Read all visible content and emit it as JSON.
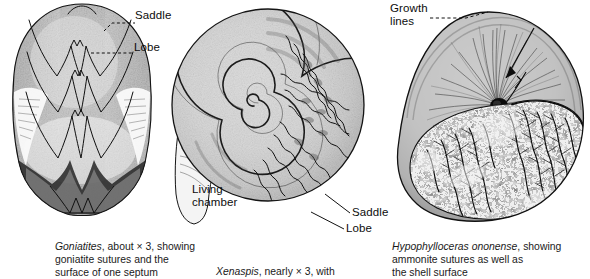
{
  "figure": {
    "background_color": "#ffffff",
    "ink_color": "#1a1a1a",
    "panels": [
      {
        "id": "goniatites",
        "subject": "goniatite-fossil-septum",
        "labels": [
          {
            "name": "saddle",
            "text": "Saddle"
          },
          {
            "name": "lobe",
            "text": "Lobe"
          }
        ],
        "caption": {
          "species": "Goniatites",
          "rest": ", about × 3, showing\ngoniatite sutures and the\nsurface of one septum"
        }
      },
      {
        "id": "xenaspis",
        "subject": "ammonite-spiral-shell-sutures",
        "labels": [
          {
            "name": "living-chamber",
            "text": "Living\nchamber"
          },
          {
            "name": "saddle",
            "text": "Saddle"
          },
          {
            "name": "lobe",
            "text": "Lobe"
          }
        ],
        "caption": {
          "species": "Xenaspis",
          "rest": ", nearly × 3, with"
        }
      },
      {
        "id": "hypophylloceras",
        "subject": "ammonite-shell-growth-lines-and-sutures",
        "labels": [
          {
            "name": "growth-lines",
            "text": "Growth\nlines"
          }
        ],
        "caption": {
          "species": "Hypophylloceras ononense",
          "rest": ", showing\nammonite sutures as well as\nthe shell surface"
        }
      }
    ]
  }
}
